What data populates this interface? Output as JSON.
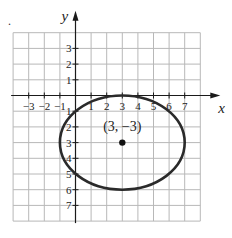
{
  "figure_marker": ".",
  "chart_data": {
    "type": "line",
    "title": "",
    "xlabel": "x",
    "ylabel": "y",
    "xlim": [
      -4,
      8
    ],
    "ylim": [
      -8,
      4
    ],
    "grid": true,
    "x_tick_labels": [
      "−3",
      "−2",
      "−1",
      "1",
      "2",
      "3",
      "4",
      "5",
      "6",
      "7"
    ],
    "x_ticks": [
      -3,
      -2,
      -1,
      1,
      2,
      3,
      4,
      5,
      6,
      7
    ],
    "y_tick_labels_positive": [
      "1",
      "2",
      "3"
    ],
    "y_ticks_positive": [
      1,
      2,
      3
    ],
    "y_tick_labels_negative": [
      "1",
      "2",
      "3",
      "4",
      "5",
      "6",
      "7"
    ],
    "y_ticks_negative": [
      -1,
      -2,
      -3,
      -4,
      -5,
      -6,
      -7
    ],
    "series": [
      {
        "name": "ellipse",
        "shape": "ellipse",
        "center": [
          3,
          -3
        ],
        "semi_axis_x": 4,
        "semi_axis_y": 3,
        "color": "#2a2a2a"
      }
    ],
    "annotations": [
      {
        "text": "(3, −3)",
        "x": 3,
        "y": -3,
        "marker": "dot"
      }
    ]
  }
}
